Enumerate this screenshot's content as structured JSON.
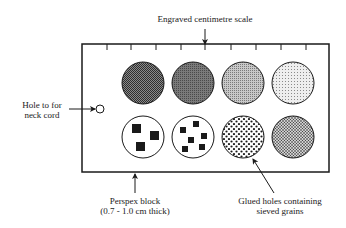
{
  "diagram": {
    "type": "labelled-schematic",
    "labels": {
      "scale": "Engraved centimetre scale",
      "hole_line1": "Hole to for",
      "hole_line2": "neck cord",
      "block_line1": "Perspex block",
      "block_line2": "(0.7 - 1.0 cm thick)",
      "holes_line1": "Glued holes containing",
      "holes_line2": "sieved grains"
    },
    "block": {
      "x": 82,
      "y": 44,
      "width": 247,
      "height": 128,
      "stroke": "#1a1a1a"
    },
    "scale_ticks_x": [
      107,
      131,
      156,
      181,
      205,
      231,
      256,
      281,
      306
    ],
    "sample_holes": {
      "top_row": [
        {
          "cx": 143,
          "cy": 83,
          "r": 21,
          "fill": "#5a5a5a",
          "texture": "very fine dark"
        },
        {
          "cx": 193,
          "cy": 83,
          "r": 21,
          "fill": "#6e6e6e",
          "texture": "fine dark"
        },
        {
          "cx": 243,
          "cy": 83,
          "r": 21,
          "fill": "#a8a8a8",
          "texture": "fine medium"
        },
        {
          "cx": 293,
          "cy": 83,
          "r": 21,
          "fill": "#d6d6d6",
          "texture": "fine light"
        }
      ],
      "bottom_row": [
        {
          "cx": 143,
          "cy": 137,
          "r": 21,
          "texture": "very coarse squares"
        },
        {
          "cx": 193,
          "cy": 137,
          "r": 21,
          "texture": "coarse squares"
        },
        {
          "cx": 243,
          "cy": 137,
          "r": 21,
          "texture": "medium dots"
        },
        {
          "cx": 293,
          "cy": 137,
          "r": 21,
          "texture": "fine dots"
        }
      ]
    },
    "neck_hole": {
      "cx": 100,
      "cy": 109,
      "r": 4
    }
  }
}
